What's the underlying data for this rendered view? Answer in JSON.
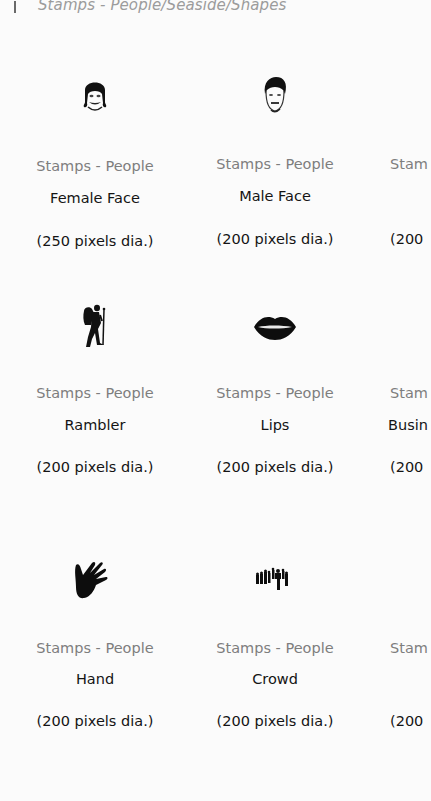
{
  "header": {
    "title": "Stamps - People/Seaside/Shapes"
  },
  "items": [
    {
      "category": "Stamps - People",
      "name": "Female Face",
      "size": "(250 pixels dia.)",
      "icon": "female-face-icon"
    },
    {
      "category": "Stamps - People",
      "name": "Male Face",
      "size": "(200 pixels dia.)",
      "icon": "male-face-icon"
    },
    {
      "category": "Stam",
      "name": "",
      "size": "(200",
      "icon": ""
    },
    {
      "category": "Stamps - People",
      "name": "Rambler",
      "size": "(200 pixels dia.)",
      "icon": "rambler-hiker-icon"
    },
    {
      "category": "Stamps - People",
      "name": "Lips",
      "size": "(200 pixels dia.)",
      "icon": "lips-icon"
    },
    {
      "category": "Stam",
      "name": "Busin",
      "size": "(200",
      "icon": ""
    },
    {
      "category": "Stamps - People",
      "name": "Hand",
      "size": "(200 pixels dia.)",
      "icon": "hand-icon"
    },
    {
      "category": "Stamps - People",
      "name": "Crowd",
      "size": "(200 pixels dia.)",
      "icon": "crowd-icon"
    },
    {
      "category": "Stam",
      "name": "",
      "size": "(200",
      "icon": ""
    }
  ]
}
